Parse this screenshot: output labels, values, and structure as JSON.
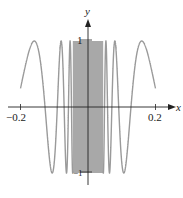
{
  "chart_data": {
    "type": "line",
    "title": "",
    "function": "y = cos(1/x)",
    "xlabel": "x",
    "ylabel": "y",
    "xlim": [
      -0.2,
      0.2
    ],
    "ylim": [
      -1,
      1
    ],
    "x_ticks": [
      -0.2,
      0.2
    ],
    "x_tick_labels": [
      "−0.2",
      "0.2"
    ],
    "y_ticks": [
      1,
      -1
    ],
    "y_tick_labels": [
      "1",
      "−1"
    ],
    "grid": false,
    "legend": null,
    "series": [
      {
        "name": "cos(1/x)",
        "color": "#9a9a9a",
        "x": [
          -0.2,
          -0.18,
          -0.159,
          -0.14,
          -0.127,
          -0.106,
          -0.091,
          -0.08,
          -0.071,
          -0.064,
          0.064,
          0.071,
          0.08,
          0.091,
          0.106,
          0.127,
          0.14,
          0.159,
          0.18,
          0.2
        ],
        "values": [
          0.284,
          0.76,
          1.0,
          0.63,
          0.0,
          -1.0,
          0.0,
          1.0,
          0.0,
          -1.0,
          -1.0,
          0.0,
          1.0,
          0.0,
          -1.0,
          0.0,
          0.63,
          1.0,
          0.76,
          0.284
        ]
      }
    ],
    "annotations": [
      "dense oscillation shaded near x = 0"
    ]
  },
  "axes": {
    "x_label": "x",
    "y_label": "y",
    "tick_neg": "−0.2",
    "tick_pos": "0.2",
    "tick_top": "1",
    "tick_bottom": "−1"
  },
  "colors": {
    "curve": "#9a9a9a",
    "dense_fill": "#a8a8a8",
    "axis": "#222222"
  }
}
